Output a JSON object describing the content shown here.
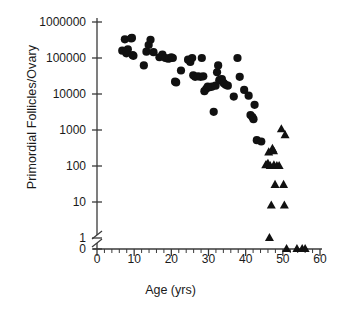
{
  "chart_data": {
    "type": "scatter",
    "title": "",
    "xlabel": "Age (yrs)",
    "ylabel": "Primordial Follicles/Ovary",
    "xlim": [
      0,
      60
    ],
    "xticks": [
      0,
      10,
      20,
      30,
      40,
      50,
      60
    ],
    "xtick_labels": [
      "0",
      "10",
      "20",
      "30",
      "40",
      "50",
      "60"
    ],
    "x_minor_tick_step": 2,
    "yscale": "log",
    "ylim": [
      1,
      1000000
    ],
    "yticks": [
      1000000,
      100000,
      10000,
      1000,
      100,
      10,
      1,
      0
    ],
    "ytick_labels": [
      "1000000",
      "100000",
      "10000",
      "1000",
      "100",
      "10",
      "1",
      "0"
    ],
    "y_axis_break": true,
    "y_axis_break_between": [
      1,
      0
    ],
    "grid": false,
    "legend": "none",
    "series": [
      {
        "name": "circles",
        "marker": "circle",
        "color": "#111111",
        "points": [
          [
            6.8,
            160000
          ],
          [
            7.5,
            330000
          ],
          [
            7.9,
            135000
          ],
          [
            8.3,
            175000
          ],
          [
            9.2,
            350000
          ],
          [
            9.4,
            360000
          ],
          [
            9.6,
            120000
          ],
          [
            9.8,
            115000
          ],
          [
            12.6,
            62000
          ],
          [
            13.3,
            150000
          ],
          [
            13.9,
            230000
          ],
          [
            14.4,
            320000
          ],
          [
            15.2,
            145000
          ],
          [
            16.8,
            105000
          ],
          [
            17.6,
            125000
          ],
          [
            18.4,
            100000
          ],
          [
            19.1,
            96000
          ],
          [
            19.6,
            98000
          ],
          [
            20.0,
            105000
          ],
          [
            20.4,
            100000
          ],
          [
            21.0,
            22000
          ],
          [
            21.3,
            21000
          ],
          [
            22.6,
            45000
          ],
          [
            24.5,
            90000
          ],
          [
            25.1,
            78000
          ],
          [
            25.6,
            100000
          ],
          [
            25.9,
            33000
          ],
          [
            26.4,
            30000
          ],
          [
            27.2,
            31000
          ],
          [
            27.9,
            30000
          ],
          [
            28.2,
            100000
          ],
          [
            28.6,
            31000
          ],
          [
            28.9,
            12000
          ],
          [
            29.4,
            14000
          ],
          [
            29.8,
            16000
          ],
          [
            30.3,
            15500
          ],
          [
            30.9,
            16000
          ],
          [
            31.4,
            3200
          ],
          [
            31.9,
            17000
          ],
          [
            32.3,
            40000
          ],
          [
            32.6,
            62000
          ],
          [
            32.9,
            24000
          ],
          [
            33.2,
            25000
          ],
          [
            33.6,
            26000
          ],
          [
            34.1,
            20000
          ],
          [
            34.6,
            18000
          ],
          [
            35.2,
            17000
          ],
          [
            36.8,
            8500
          ],
          [
            37.8,
            100000
          ],
          [
            38.4,
            30000
          ],
          [
            39.6,
            13000
          ],
          [
            40.8,
            9000
          ],
          [
            41.3,
            2600
          ],
          [
            41.8,
            2300
          ],
          [
            42.1,
            2000
          ],
          [
            42.4,
            5000
          ],
          [
            43.0,
            520
          ],
          [
            44.2,
            480
          ]
        ]
      },
      {
        "name": "triangles",
        "marker": "triangle",
        "color": "#111111",
        "points": [
          [
            45.4,
            105
          ],
          [
            45.8,
            110
          ],
          [
            46.0,
            115
          ],
          [
            46.2,
            240
          ],
          [
            46.4,
            1.0
          ],
          [
            46.6,
            100
          ],
          [
            46.9,
            8
          ],
          [
            47.2,
            300
          ],
          [
            47.5,
            260
          ],
          [
            47.6,
            105
          ],
          [
            47.9,
            30
          ],
          [
            48.4,
            100
          ],
          [
            49.0,
            100
          ],
          [
            49.6,
            1050
          ],
          [
            50.2,
            30
          ],
          [
            50.4,
            8
          ],
          [
            50.6,
            720
          ],
          [
            51.0,
            0
          ],
          [
            53.8,
            0
          ],
          [
            55.2,
            0
          ],
          [
            56.0,
            0
          ]
        ]
      }
    ]
  },
  "axes": {
    "y_break_symbol": "axis-break"
  }
}
